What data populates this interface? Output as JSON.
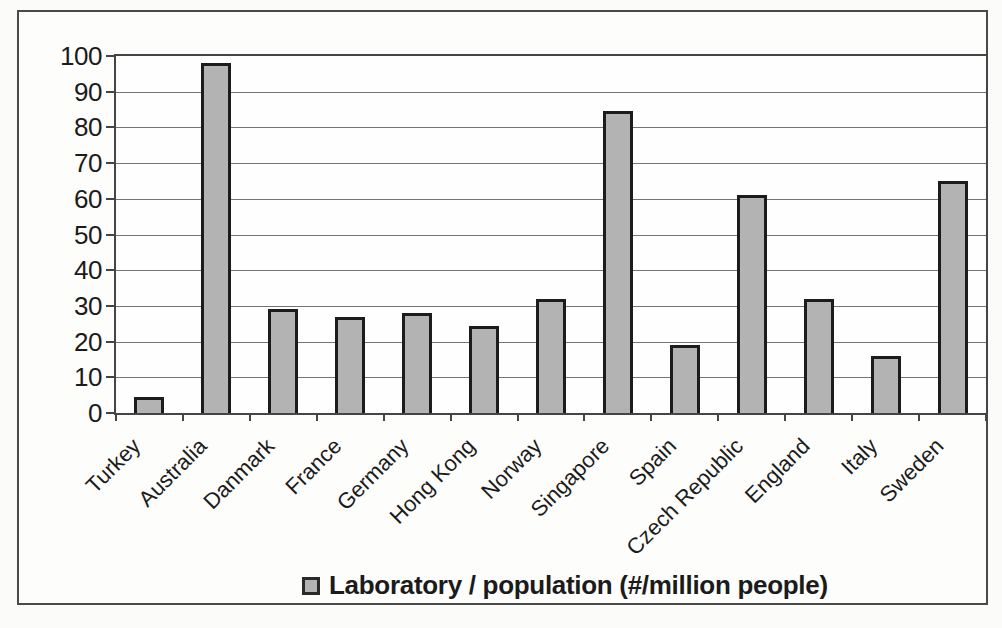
{
  "figure": {
    "background": "#fdfdfc",
    "frame_color": "#4a4a4a"
  },
  "chart_data": {
    "type": "bar",
    "categories": [
      "Turkey",
      "Australia",
      "Danmark",
      "France",
      "Germany",
      "Hong Kong",
      "Norway",
      "Singapore",
      "Spain",
      "Czech Republic",
      "England",
      "Italy",
      "Sweden"
    ],
    "values": [
      4.5,
      98,
      29,
      27,
      28,
      24.5,
      32,
      84.5,
      19,
      61,
      32,
      16,
      65
    ],
    "title": "",
    "xlabel": "",
    "ylabel": "",
    "ylim": [
      0,
      100
    ],
    "ytick_step": 10,
    "ytick_labels": [
      "0",
      "10",
      "20",
      "30",
      "40",
      "50",
      "60",
      "70",
      "80",
      "90",
      "100"
    ],
    "grid": "horizontal",
    "legend": {
      "label": "Laboratory / population (#/million people)",
      "position": "bottom",
      "marker": "square"
    },
    "colors": {
      "bar_fill": "#b3b3b3",
      "bar_border": "#1c1c1c",
      "gridline": "#747474",
      "axis": "#454545",
      "text": "#1b1b1b"
    }
  }
}
